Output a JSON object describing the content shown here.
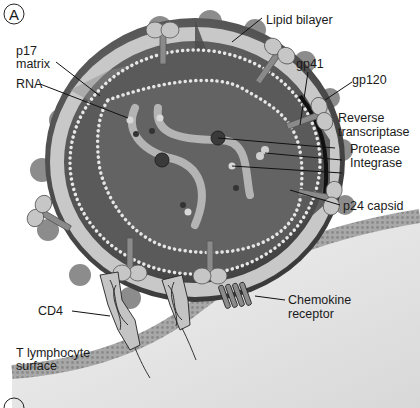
{
  "figure": {
    "panel_label": "A",
    "next_panel_label_partial": "B"
  },
  "labels": {
    "lipid_bilayer": "Lipid bilayer",
    "p17_line1": "p17",
    "p17_line2": "matrix",
    "rna": "RNA",
    "gp41": "gp41",
    "gp120": "gp120",
    "reverse_transcriptase_line1": "Reverse",
    "reverse_transcriptase_line2": "transcriptase",
    "protease": "Protease",
    "integrase": "Integrase",
    "p24_capsid": "p24 capsid",
    "cd4": "CD4",
    "chemokine_line1": "Chemokine",
    "chemokine_line2": "receptor",
    "t_cell_line1": "T lymphocyte",
    "t_cell_line2": "surface"
  },
  "colors": {
    "virion_dark": "#4a4a4a",
    "virion_mid": "#6e6e6e",
    "bilayer_light": "#c9c9c9",
    "capsid_fill": "#5e5e5e",
    "bead": "#e6e6e6",
    "membrane": "#9a9a9a",
    "cell_bg": "#e4e4e4"
  }
}
